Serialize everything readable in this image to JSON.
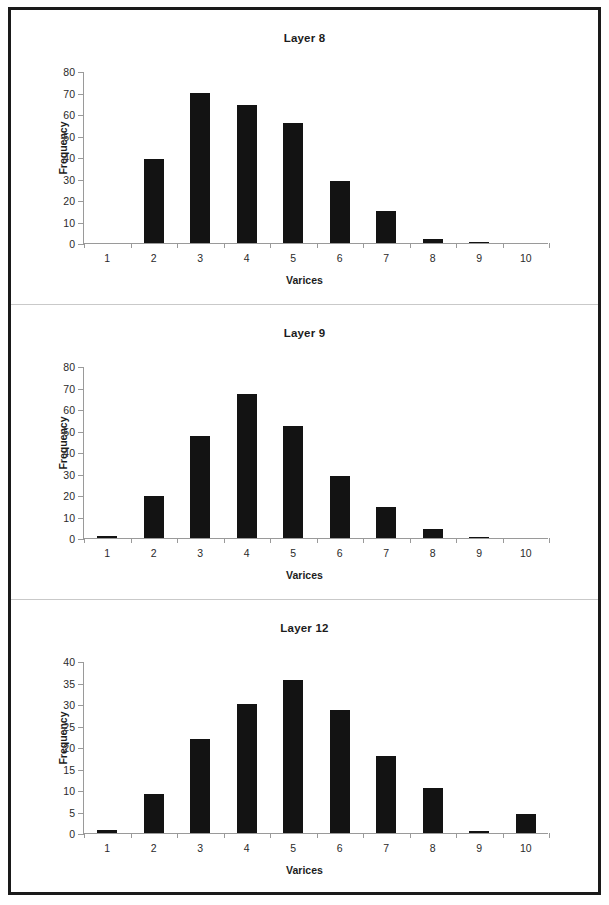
{
  "figure": {
    "panel_count": 3,
    "background": "#ffffff",
    "frame_color": "#1a1a1a",
    "bar_color": "#131313",
    "axis_color": "#9a9a9a"
  },
  "chart_data": [
    {
      "type": "bar",
      "title": "Layer 8",
      "xlabel": "Varices",
      "ylabel": "Frequency",
      "categories": [
        "1",
        "2",
        "3",
        "4",
        "5",
        "6",
        "7",
        "8",
        "9",
        "10"
      ],
      "values": [
        0,
        39,
        70,
        64,
        56,
        29,
        15,
        2,
        0.5,
        0
      ],
      "ylim": [
        0,
        80
      ],
      "yticks": [
        0,
        10,
        20,
        30,
        40,
        50,
        60,
        70,
        80
      ],
      "grid": false,
      "legend": null
    },
    {
      "type": "bar",
      "title": "Layer 9",
      "xlabel": "Varices",
      "ylabel": "Frequency",
      "categories": [
        "1",
        "2",
        "3",
        "4",
        "5",
        "6",
        "7",
        "8",
        "9",
        "10"
      ],
      "values": [
        1,
        19.5,
        47.5,
        67,
        52,
        29,
        14.5,
        4,
        0.5,
        0
      ],
      "ylim": [
        0,
        80
      ],
      "yticks": [
        0,
        10,
        20,
        30,
        40,
        50,
        60,
        70,
        80
      ],
      "grid": false,
      "legend": null
    },
    {
      "type": "bar",
      "title": "Layer 12",
      "xlabel": "Varices",
      "ylabel": "Frequency",
      "categories": [
        "1",
        "2",
        "3",
        "4",
        "5",
        "6",
        "7",
        "8",
        "9",
        "10"
      ],
      "values": [
        0.8,
        9,
        21.8,
        30,
        35.7,
        28.7,
        17.8,
        10.4,
        0.5,
        4.4
      ],
      "ylim": [
        0,
        40
      ],
      "yticks": [
        0,
        5,
        10,
        15,
        20,
        25,
        30,
        35,
        40
      ],
      "grid": false,
      "legend": null
    }
  ],
  "panels": [
    {
      "top": 0,
      "height": 295,
      "divider": true
    },
    {
      "top": 295,
      "height": 295,
      "divider": true
    },
    {
      "top": 590,
      "height": 292,
      "divider": false
    }
  ],
  "plot_geometry": {
    "left": 72,
    "top": 62,
    "width": 465,
    "height": 172,
    "title_top": 22,
    "ylabel_top": 100,
    "ylabel_left": -8,
    "xlabel_top": 256
  }
}
